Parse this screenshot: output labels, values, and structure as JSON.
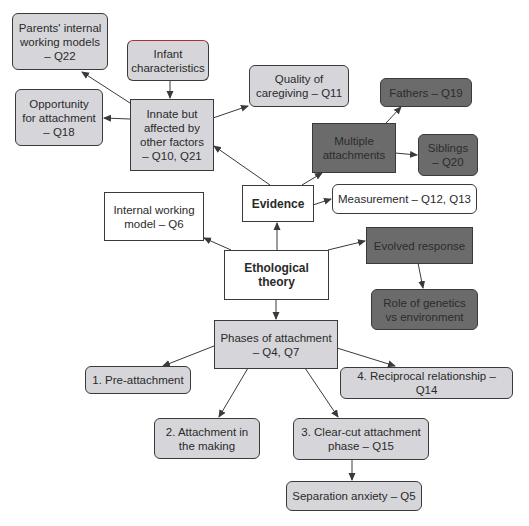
{
  "diagram": {
    "type": "concept-map",
    "central_node": "Ethological theory",
    "nodes": {
      "parents_iwm": {
        "label": "Parents' internal\nworking models\n– Q22",
        "style": "light"
      },
      "infant_char": {
        "label": "Infant\ncharacteristics",
        "style": "light"
      },
      "opportunity": {
        "label": "Opportunity\nfor attachment\n– Q18",
        "style": "light"
      },
      "innate": {
        "label": "Innate but\naffected by\nother factors\n– Q10, Q21",
        "style": "light"
      },
      "quality": {
        "label": "Quality of\ncaregiving – Q11",
        "style": "light"
      },
      "fathers": {
        "label": "Fathers – Q19",
        "style": "dark"
      },
      "multiple": {
        "label": "Multiple\nattachments",
        "style": "dark"
      },
      "siblings": {
        "label": "Siblings\n– Q20",
        "style": "dark"
      },
      "evidence": {
        "label": "Evidence",
        "style": "white"
      },
      "measurement": {
        "label": "Measurement – Q12, Q13",
        "style": "white"
      },
      "iwm": {
        "label": "Internal working\nmodel – Q6",
        "style": "white"
      },
      "evolved": {
        "label": "Evolved response",
        "style": "dark"
      },
      "ethological": {
        "label": "Ethological\ntheory",
        "style": "white"
      },
      "genetics": {
        "label": "Role of genetics\nvs environment",
        "style": "dark"
      },
      "phases": {
        "label": "Phases of attachment\n– Q4, Q7",
        "style": "light"
      },
      "pre": {
        "label": "1.  Pre-attachment",
        "style": "light"
      },
      "reciprocal": {
        "label": "4.  Reciprocal relationship – Q14",
        "style": "light"
      },
      "making": {
        "label": "2.  Attachment in\nthe making",
        "style": "light"
      },
      "clearcut": {
        "label": "3.  Clear-cut attachment\nphase – Q15",
        "style": "light"
      },
      "separation": {
        "label": "Separation anxiety – Q5",
        "style": "light"
      }
    },
    "edges": [
      [
        "ethological",
        "evidence"
      ],
      [
        "ethological",
        "iwm"
      ],
      [
        "ethological",
        "evolved"
      ],
      [
        "ethological",
        "phases"
      ],
      [
        "evidence",
        "innate"
      ],
      [
        "evidence",
        "multiple"
      ],
      [
        "evidence",
        "measurement"
      ],
      [
        "innate",
        "parents_iwm"
      ],
      [
        "innate",
        "opportunity"
      ],
      [
        "innate",
        "quality"
      ],
      [
        "infant_char",
        "innate"
      ],
      [
        "multiple",
        "fathers"
      ],
      [
        "multiple",
        "siblings"
      ],
      [
        "evolved",
        "genetics"
      ],
      [
        "phases",
        "pre"
      ],
      [
        "phases",
        "making"
      ],
      [
        "phases",
        "clearcut"
      ],
      [
        "phases",
        "reciprocal"
      ],
      [
        "clearcut",
        "separation"
      ]
    ],
    "colors": {
      "light_fill": "#d6d6da",
      "dark_fill": "#6b6b6b",
      "white_fill": "#ffffff",
      "border": "#3a3a3a",
      "arrow": "#3a3a3a"
    }
  }
}
